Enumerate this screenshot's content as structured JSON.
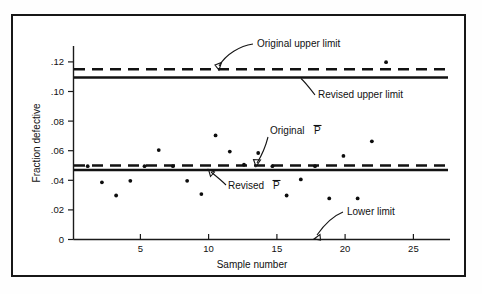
{
  "chart_data": {
    "type": "scatter",
    "title": "",
    "xlabel": "Sample number",
    "ylabel": "Fraction defective",
    "xlim": [
      0,
      26.5
    ],
    "ylim": [
      0,
      0.132
    ],
    "grid": false,
    "legend": "none",
    "x": [
      1,
      2,
      3,
      4,
      5,
      6,
      7,
      8,
      9,
      10,
      11,
      12,
      13,
      14,
      15,
      16,
      17,
      18,
      19,
      20,
      21,
      22
    ],
    "values": [
      0.05,
      0.039,
      0.03,
      0.04,
      0.05,
      0.061,
      0.05,
      0.04,
      0.031,
      0.071,
      0.06,
      0.051,
      0.059,
      0.05,
      0.03,
      0.041,
      0.05,
      0.028,
      0.057,
      0.028,
      0.067,
      0.121
    ],
    "xticks": [
      5,
      10,
      15,
      20,
      25
    ],
    "xticklabels": [
      "5",
      "10",
      "15",
      "20",
      "25"
    ],
    "yticks": [
      0,
      0.02,
      0.04,
      0.06,
      0.08,
      0.1,
      0.12
    ],
    "yticklabels": [
      "0",
      ".02",
      ".04",
      ".06",
      ".08",
      ".10",
      ".12"
    ],
    "reference_lines": [
      {
        "name": "original-upper-limit",
        "label": "Original upper limit",
        "value": 0.1146,
        "style": "dashed"
      },
      {
        "name": "revised-upper-limit",
        "label": "Revised upper limit",
        "value": 0.109,
        "style": "solid"
      },
      {
        "name": "original-pbar",
        "label": "Original P̄",
        "value": 0.05,
        "style": "dashed"
      },
      {
        "name": "revised-pbar",
        "label": "Revised P̄",
        "value": 0.047,
        "style": "solid"
      },
      {
        "name": "lower-limit",
        "label": "Lower limit",
        "value": 0.0,
        "style": "solid"
      }
    ]
  },
  "annotations": {
    "original_upper_limit": "Original upper limit",
    "revised_upper_limit": "Revised upper limit",
    "original_pbar_pre": "Original",
    "original_pbar_sym": "P",
    "revised_pbar_pre": "Revised",
    "revised_pbar_sym": "P",
    "lower_limit": "Lower limit"
  },
  "axes": {
    "x_title": "Sample number",
    "y_title": "Fraction defective",
    "x_tick_5": "5",
    "x_tick_10": "10",
    "x_tick_15": "15",
    "x_tick_20": "20",
    "x_tick_25": "25",
    "y_tick_0": "0",
    "y_tick_02": ".02",
    "y_tick_04": ".04",
    "y_tick_06": ".06",
    "y_tick_08": ".08",
    "y_tick_10": ".10",
    "y_tick_12": ".12"
  },
  "colors": {
    "ink": "#121212",
    "frame": "#171717",
    "background": "#ffffff"
  }
}
